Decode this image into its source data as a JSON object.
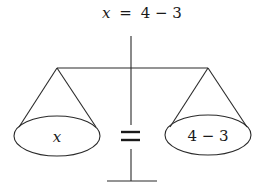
{
  "diagram": {
    "type": "balance-scale",
    "title": {
      "variable": "x",
      "equals": "=",
      "expression": "4 − 3"
    },
    "left_pan": {
      "label": "x"
    },
    "right_pan": {
      "label": "4 − 3"
    },
    "center_symbol": "=",
    "colors": {
      "line": "#2a2a2a",
      "text": "#1a1a1a",
      "background": "#ffffff"
    }
  }
}
